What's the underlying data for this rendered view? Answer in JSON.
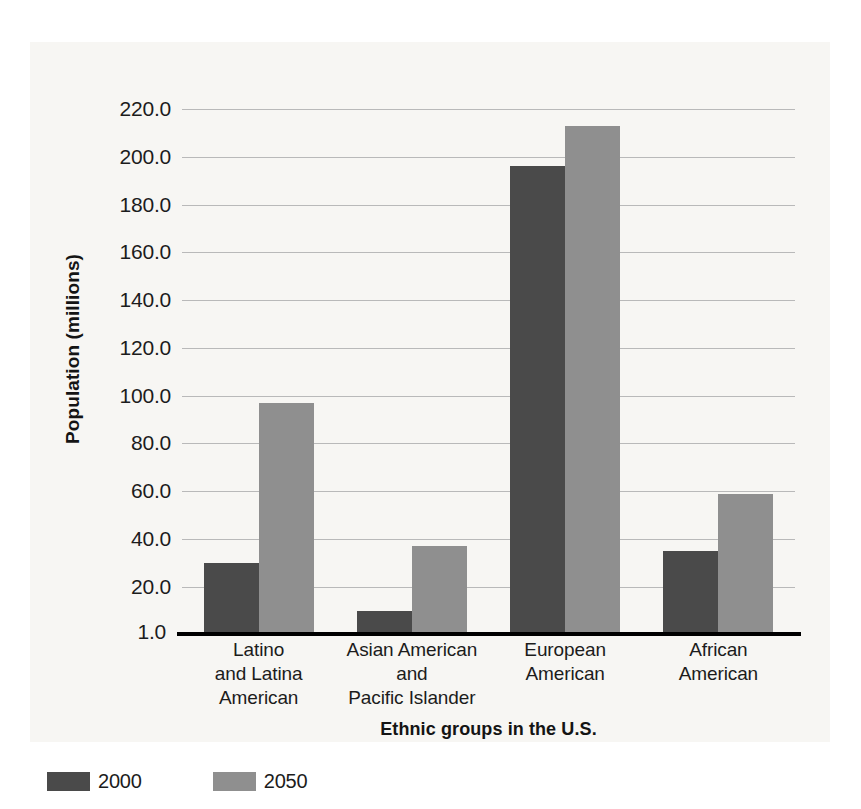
{
  "chart_data": {
    "type": "bar",
    "title": "",
    "xlabel": "Ethnic groups in the U.S.",
    "ylabel": "Population (millions)",
    "categories": [
      "Latino\nand Latina\nAmerican",
      "Asian American\nand\nPacific Islander",
      "European\nAmerican",
      "African\nAmerican"
    ],
    "category_lines": [
      [
        "Latino",
        "and Latina",
        "American"
      ],
      [
        "Asian American",
        "and",
        "Pacific Islander"
      ],
      [
        "European",
        "American"
      ],
      [
        "African",
        "American"
      ]
    ],
    "series": [
      {
        "name": "2000",
        "color": "#4a4a4a",
        "values": [
          30,
          10,
          196,
          35
        ]
      },
      {
        "name": "2050",
        "color": "#8f8f8f",
        "values": [
          97,
          37,
          213,
          59
        ]
      }
    ],
    "ylim": [
      1.0,
      228
    ],
    "yticks": [
      220.0,
      200.0,
      180.0,
      160.0,
      140.0,
      120.0,
      100.0,
      80.0,
      60.0,
      40.0,
      20.0
    ],
    "ytick_labels": [
      "220.0",
      "200.0",
      "180.0",
      "160.0",
      "140.0",
      "120.0",
      "100.0",
      "80.0",
      "60.0",
      "40.0",
      "20.0"
    ],
    "baseline_label": "1.0",
    "baseline_value": 1.0,
    "grid": true,
    "legend_position": "bottom-left"
  },
  "legend": {
    "items": [
      {
        "label": "2000",
        "color": "#4a4a4a"
      },
      {
        "label": "2050",
        "color": "#8f8f8f"
      }
    ]
  },
  "colors": {
    "series_2000": "#4a4a4a",
    "series_2050": "#8f8f8f",
    "gridline": "#b9b9b9",
    "axis": "#000000",
    "background": "#f7f6f3",
    "text": "#1c1c1c"
  }
}
